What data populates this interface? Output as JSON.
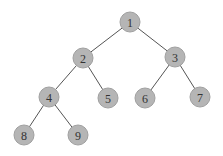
{
  "diagram": {
    "type": "binary-tree",
    "colors": {
      "node_fill": "#b5b5b5",
      "node_stroke": "#a0a0a0",
      "edge": "#555555",
      "label": "#333333",
      "background": "#ffffff"
    },
    "node_radius": 10,
    "nodes": [
      {
        "id": "1",
        "label": "1",
        "x": 130,
        "y": 22
      },
      {
        "id": "2",
        "label": "2",
        "x": 83,
        "y": 58
      },
      {
        "id": "3",
        "label": "3",
        "x": 175,
        "y": 57
      },
      {
        "id": "4",
        "label": "4",
        "x": 49,
        "y": 97
      },
      {
        "id": "5",
        "label": "5",
        "x": 108,
        "y": 98
      },
      {
        "id": "6",
        "label": "6",
        "x": 145,
        "y": 98
      },
      {
        "id": "7",
        "label": "7",
        "x": 200,
        "y": 97
      },
      {
        "id": "8",
        "label": "8",
        "x": 24,
        "y": 135
      },
      {
        "id": "9",
        "label": "9",
        "x": 78,
        "y": 135
      }
    ],
    "edges": [
      {
        "from": "1",
        "to": "2"
      },
      {
        "from": "1",
        "to": "3"
      },
      {
        "from": "2",
        "to": "4"
      },
      {
        "from": "2",
        "to": "5"
      },
      {
        "from": "3",
        "to": "6"
      },
      {
        "from": "3",
        "to": "7"
      },
      {
        "from": "4",
        "to": "8"
      },
      {
        "from": "4",
        "to": "9"
      }
    ]
  }
}
